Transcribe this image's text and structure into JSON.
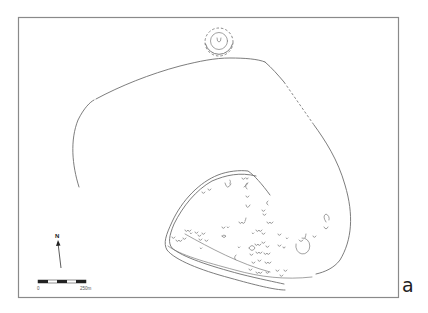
{
  "figure": {
    "panel_label": "a",
    "north_arrow": {
      "label": "N",
      "icon": "north-arrow-icon"
    },
    "scale_bar": {
      "start_label": "0",
      "end_label": "250m",
      "segments": 5
    },
    "features": [
      {
        "name": "outer-enclosure",
        "type": "boundary line",
        "partially_dashed": true
      },
      {
        "name": "hilltop-mound",
        "type": "concentric circles",
        "location": "top-center"
      },
      {
        "name": "inner-fortified-enclosure",
        "type": "double wall line",
        "location": "lower-right"
      },
      {
        "name": "pit-features",
        "type": "horseshoe/U-shaped features",
        "location": "within inner enclosure"
      }
    ],
    "colors": {
      "line": "#6e6e6e",
      "frame": "#8a8a8a",
      "background": "#ffffff"
    }
  }
}
